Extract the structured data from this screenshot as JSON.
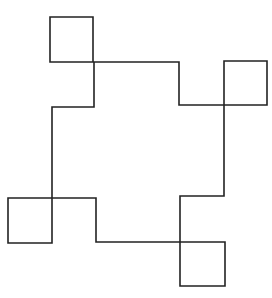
{
  "diagram": {
    "stroke_color": "#222222",
    "background": "#ffffff",
    "path_points": [
      [
        50,
        17
      ],
      [
        93,
        17
      ],
      [
        93,
        62
      ],
      [
        179,
        62
      ],
      [
        179,
        105
      ],
      [
        267,
        105
      ],
      [
        267,
        61
      ],
      [
        224,
        61
      ],
      [
        224,
        196
      ],
      [
        180,
        196
      ],
      [
        180,
        286
      ],
      [
        225,
        286
      ],
      [
        225,
        242
      ],
      [
        96,
        242
      ],
      [
        96,
        198
      ],
      [
        8,
        198
      ],
      [
        8,
        243
      ],
      [
        52,
        243
      ],
      [
        52,
        107
      ],
      [
        94,
        107
      ],
      [
        94,
        62
      ],
      [
        50,
        62
      ]
    ],
    "loops": [
      {
        "name": "top-left-loop",
        "x": 50,
        "y": 17,
        "w": 43,
        "h": 45
      },
      {
        "name": "top-right-loop",
        "x": 224,
        "y": 61,
        "w": 43,
        "h": 44
      },
      {
        "name": "bottom-left-loop",
        "x": 8,
        "y": 198,
        "w": 44,
        "h": 45
      },
      {
        "name": "bottom-right-loop",
        "x": 180,
        "y": 242,
        "w": 45,
        "h": 44
      }
    ]
  }
}
